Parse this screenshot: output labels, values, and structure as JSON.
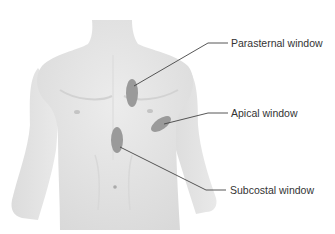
{
  "figure": {
    "colors": {
      "background": "#ffffff",
      "skin": "#e6e6e6",
      "skin_shadow": "#cfcfcf",
      "window_fill": "#9a9a9a",
      "leader_line": "#444444",
      "label_text": "#333333"
    },
    "labels": [
      {
        "id": "parasternal",
        "text": "Parasternal window"
      },
      {
        "id": "apical",
        "text": "Apical window"
      },
      {
        "id": "subcostal",
        "text": "Subcostal window"
      }
    ]
  }
}
